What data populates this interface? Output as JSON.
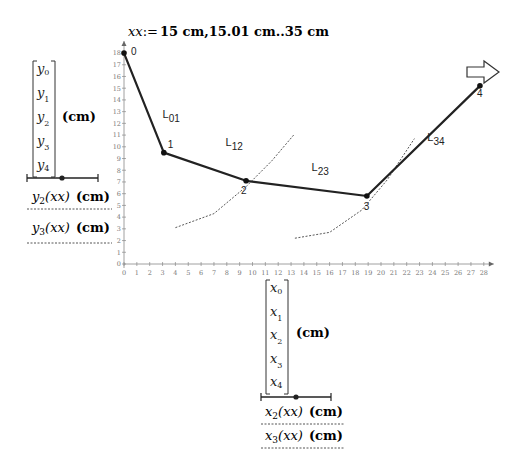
{
  "definition": {
    "variable": "xx",
    "assign_op": ":=",
    "range_text": "15 cm,15.01 cm..35 cm"
  },
  "y_legend": {
    "vector_entries": [
      "y",
      "y",
      "y",
      "y",
      "y"
    ],
    "vector_subscripts": [
      "0",
      "1",
      "2",
      "3",
      "4"
    ],
    "unit": "(cm)",
    "traces": [
      {
        "func": "y",
        "sub": "2",
        "arg": "(xx)",
        "unit": "(cm)"
      },
      {
        "func": "y",
        "sub": "3",
        "arg": "(xx)",
        "unit": "(cm)"
      }
    ]
  },
  "x_legend": {
    "vector_entries": [
      "x",
      "x",
      "x",
      "x",
      "x"
    ],
    "vector_subscripts": [
      "0",
      "1",
      "2",
      "3",
      "4"
    ],
    "unit": "(cm)",
    "traces": [
      {
        "func": "x",
        "sub": "2",
        "arg": "(xx)",
        "unit": "(cm)"
      },
      {
        "func": "x",
        "sub": "3",
        "arg": "(xx)",
        "unit": "(cm)"
      }
    ]
  },
  "chart_data": {
    "type": "line",
    "title": "xx:=15 cm,15.01 cm..35 cm",
    "xlabel": "x (cm)",
    "ylabel": "y (cm)",
    "xlim": [
      0,
      28
    ],
    "ylim": [
      0,
      18
    ],
    "x_ticks": [
      0,
      1,
      2,
      3,
      4,
      5,
      6,
      7,
      8,
      9,
      10,
      11,
      12,
      13,
      14,
      15,
      16,
      17,
      18,
      19,
      20,
      21,
      22,
      23,
      24,
      25,
      26,
      27,
      28
    ],
    "y_ticks": [
      0,
      1,
      2,
      3,
      4,
      5,
      6,
      7,
      8,
      9,
      10,
      11,
      12,
      13,
      14,
      15,
      16,
      17,
      18
    ],
    "grid": false,
    "series": [
      {
        "name": "linkage (y vs x)",
        "style": "solid",
        "points": [
          {
            "label": "0",
            "x": 0,
            "y": 18
          },
          {
            "label": "1",
            "x": 3.1,
            "y": 9.5
          },
          {
            "label": "2",
            "x": 9.5,
            "y": 7.1
          },
          {
            "label": "3",
            "x": 18.9,
            "y": 5.8
          },
          {
            "label": "4",
            "x": 27.7,
            "y": 15.2
          }
        ]
      },
      {
        "name": "y2(xx) vs x2(xx)",
        "style": "dashed",
        "points": [
          {
            "x": 4.0,
            "y": 3.1
          },
          {
            "x": 7.0,
            "y": 4.3
          },
          {
            "x": 9.5,
            "y": 6.6
          },
          {
            "x": 11.5,
            "y": 8.8
          },
          {
            "x": 13.2,
            "y": 11.0
          }
        ]
      },
      {
        "name": "y3(xx) vs x3(xx)",
        "style": "dashed",
        "points": [
          {
            "x": 13.3,
            "y": 2.2
          },
          {
            "x": 16.0,
            "y": 2.7
          },
          {
            "x": 18.5,
            "y": 4.6
          },
          {
            "x": 20.5,
            "y": 7.2
          },
          {
            "x": 22.6,
            "y": 10.7
          }
        ]
      }
    ],
    "annotations": [
      {
        "text": "L01",
        "base": "L",
        "sub": "01",
        "x": 3.0,
        "y": 12.5
      },
      {
        "text": "L12",
        "base": "L",
        "sub": "12",
        "x": 7.9,
        "y": 10.1
      },
      {
        "text": "L23",
        "base": "L",
        "sub": "23",
        "x": 14.6,
        "y": 7.9
      },
      {
        "text": "L34",
        "base": "L",
        "sub": "34",
        "x": 23.6,
        "y": 10.5
      },
      {
        "text": "direction arrow",
        "shape": "right-arrow",
        "x": 27.5,
        "y": 16.2
      }
    ]
  }
}
